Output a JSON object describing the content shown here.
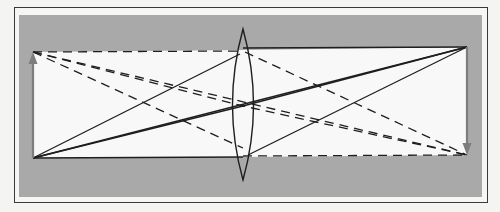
{
  "diagram": {
    "type": "thin-lens-ray-diagram",
    "colors": {
      "page_background": "#f4f4f2",
      "frame_border": "#3a3a3a",
      "panel_gray": "#a9a9a9",
      "band_white": "#f8f8f8",
      "ray_color": "#1e1e1e",
      "arrow_color": "#7d7d7d"
    },
    "object_arrow": {
      "x": 33,
      "y_base": 158,
      "y_tip": 52,
      "direction": "up"
    },
    "image_arrow": {
      "x": 467,
      "y_base": 47,
      "y_tip": 155,
      "direction": "down"
    },
    "lens": {
      "type": "biconvex",
      "center_x": 243,
      "top_y": 29,
      "bottom_y": 180,
      "half_width": 11
    },
    "rays": {
      "solid": [
        {
          "from": [
            33,
            158
          ],
          "to": [
            467,
            47
          ]
        },
        {
          "from": [
            33,
            158
          ],
          "to": [
            243,
            106
          ],
          "then": [
            467,
            47
          ]
        }
      ],
      "dashed": [
        {
          "from": [
            33,
            52
          ],
          "to": [
            467,
            155
          ]
        },
        {
          "from": [
            33,
            52
          ],
          "to": [
            243,
            106
          ],
          "then": [
            467,
            155
          ]
        },
        {
          "from": [
            33,
            52
          ],
          "to": [
            243,
            52
          ],
          "then": [
            467,
            155
          ]
        },
        {
          "from": [
            243,
            155
          ],
          "to": [
            467,
            155
          ]
        }
      ],
      "band_top_solid": {
        "from": [
          243,
          47
        ],
        "to": [
          467,
          47
        ]
      },
      "band_bottom_solid": {
        "from": [
          33,
          158
        ],
        "to": [
          243,
          158
        ]
      },
      "extra_solid": [
        {
          "from": [
            33,
            158
          ],
          "to": [
            243,
            52
          ],
          "then": [
            467,
            47
          ]
        },
        {
          "from": [
            243,
            155
          ],
          "to": [
            467,
            47
          ]
        }
      ]
    }
  }
}
